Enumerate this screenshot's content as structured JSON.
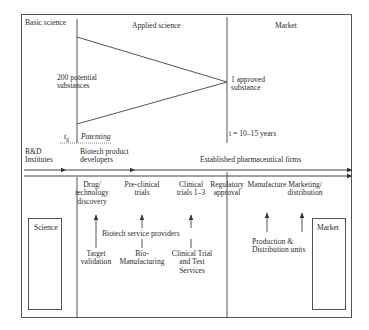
{
  "diagram": {
    "type": "pharmaceutical-value-chain",
    "regions": {
      "basic_science": "Basic science",
      "applied_science": "Applied science",
      "market": "Market"
    },
    "funnel": {
      "start_label_1": "200 potential",
      "start_label_2": "substances",
      "end_label_1": "1 approved",
      "end_label_2": "substance",
      "t0": "t",
      "t0_sub": "0",
      "patenting": "Patenting",
      "duration": "t = 10–15 years"
    },
    "actors": {
      "rd_institutes_1": "R&D",
      "rd_institutes_2": "Institutes",
      "biotech_developers_1": "Biotech product",
      "biotech_developers_2": "developers",
      "pharma_firms": "Established pharmaceutical firms"
    },
    "stages": [
      {
        "l1": "Drug/",
        "l2": "technology",
        "l3": "discovery"
      },
      {
        "l1": "Pre-clinical",
        "l2": "trials"
      },
      {
        "l1": "Clinical",
        "l2": "trials 1–3"
      },
      {
        "l1": "Regulatory",
        "l2": "approval"
      },
      {
        "l1": "Manufacture"
      },
      {
        "l1": "Marketing/",
        "l2": "distribution"
      }
    ],
    "service_providers": {
      "title": "Biotech service providers",
      "items": [
        {
          "l1": "Target",
          "l2": "validation"
        },
        {
          "l1": "Bio-",
          "l2": "Manufacturing"
        },
        {
          "l1": "Clinical Trial",
          "l2": "and Test",
          "l3": "Services"
        }
      ]
    },
    "production": {
      "l1": "Production &",
      "l2": "Distribution units"
    },
    "boxes": {
      "science": "Science",
      "market": "Market"
    }
  },
  "colors": {
    "line": "#444444",
    "text": "#2a2a2a",
    "background": "#ffffff"
  }
}
